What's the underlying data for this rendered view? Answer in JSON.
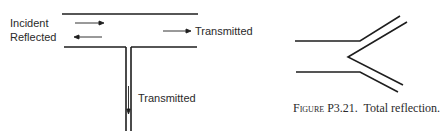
{
  "left_figure": {
    "labels": {
      "incident": "Incident",
      "reflected": "Reflected",
      "transmitted_through": "Transmitted",
      "transmitted_branch": "Transmitted"
    }
  },
  "right_figure": {
    "caption": {
      "prefix": "Figure",
      "number": "P3.21.",
      "text": "Total reflection."
    }
  },
  "colors": {
    "line": "#1e1e1e",
    "text": "#2a2a2a",
    "background": "#ffffff"
  }
}
